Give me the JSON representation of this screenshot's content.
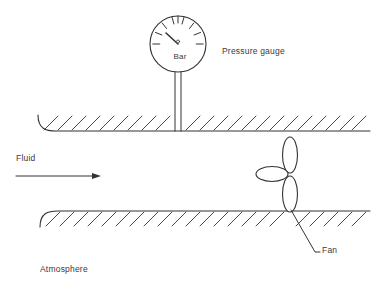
{
  "diagram": {
    "stroke_color": "#333333",
    "background": "#ffffff",
    "labels": {
      "pressure_gauge": "Pressure gauge",
      "fluid": "Fluid",
      "fan": "Fan",
      "atmosphere": "Atmosphere",
      "gauge_unit": "Bar"
    },
    "gauge": {
      "unit": "Bar",
      "tick_count": 9,
      "needle_direction": "up-left",
      "center_x": 178,
      "center_y": 44,
      "radius": 28
    },
    "fan": {
      "blade_count": 3,
      "blade_directions": [
        "up",
        "down",
        "left"
      ],
      "hub_x": 290,
      "hub_y": 176
    },
    "flow_arrow": {
      "direction": "right",
      "x_start": 16,
      "x_end": 96,
      "y": 176
    },
    "walls": [
      {
        "name": "upper-duct-wall",
        "y": 130,
        "hatch_side": "above"
      },
      {
        "name": "lower-duct-wall",
        "y": 211,
        "hatch_side": "below"
      }
    ]
  }
}
